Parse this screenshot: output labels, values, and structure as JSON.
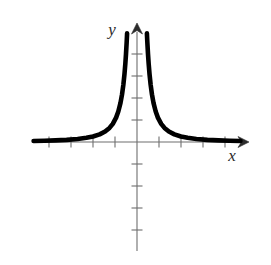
{
  "figure": {
    "background_color": "#ffffff",
    "curve_color": "#000000",
    "axis_color": "#6e6e6e",
    "label_color": "#2b2b2b",
    "x_axis_label": "x",
    "y_axis_label": "y"
  },
  "chart_data": {
    "type": "line",
    "title": "",
    "subtitle": "",
    "xlabel": "x",
    "ylabel": "y",
    "function": "y = 1/x^2",
    "grid": false,
    "legend": null,
    "legend_position": "none",
    "xlim": [
      -4.7,
      4.8
    ],
    "ylim": [
      -4.8,
      5.2
    ],
    "x_ticks": [
      -4,
      -3,
      -2,
      -1,
      1,
      2,
      3,
      4
    ],
    "y_ticks": [
      1,
      2,
      3,
      4,
      -1,
      -2,
      -3,
      -4
    ],
    "tick_labels_shown": false,
    "asymptotes": {
      "vertical": [
        0
      ],
      "horizontal": [
        0
      ]
    },
    "series": [
      {
        "name": "left branch",
        "x": [
          -4.7,
          -4.2,
          -3.7,
          -3.2,
          -2.7,
          -2.3,
          -2.0,
          -1.7,
          -1.45,
          -1.25,
          -1.1,
          -0.95,
          -0.85,
          -0.75,
          -0.68,
          -0.62,
          -0.57,
          -0.53,
          -0.5,
          -0.47,
          -0.45
        ],
        "y": [
          0.045,
          0.057,
          0.073,
          0.098,
          0.137,
          0.189,
          0.25,
          0.346,
          0.476,
          0.64,
          0.826,
          1.108,
          1.384,
          1.778,
          2.163,
          2.601,
          3.078,
          3.56,
          4.0,
          4.527,
          4.94
        ]
      },
      {
        "name": "right branch",
        "x": [
          0.45,
          0.47,
          0.5,
          0.53,
          0.57,
          0.62,
          0.68,
          0.75,
          0.85,
          0.95,
          1.1,
          1.25,
          1.45,
          1.7,
          2.0,
          2.3,
          2.7,
          3.2,
          3.7,
          4.2,
          4.7
        ],
        "y": [
          4.94,
          4.527,
          4.0,
          3.56,
          3.078,
          2.601,
          2.163,
          1.778,
          1.384,
          1.108,
          0.826,
          0.64,
          0.476,
          0.346,
          0.25,
          0.189,
          0.137,
          0.098,
          0.073,
          0.057,
          0.045
        ]
      }
    ]
  }
}
